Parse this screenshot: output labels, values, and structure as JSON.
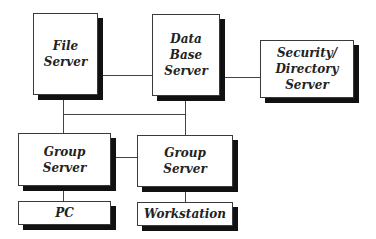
{
  "diagram": {
    "type": "network-topology",
    "nodes": [
      {
        "id": "file-server",
        "label": "File\nServer"
      },
      {
        "id": "database-server",
        "label": "Data\nBase\nServer"
      },
      {
        "id": "security-directory-server",
        "label": "Security/\nDirectory\nServer"
      },
      {
        "id": "group-server-1",
        "label": "Group\nServer"
      },
      {
        "id": "group-server-2",
        "label": "Group\nServer"
      },
      {
        "id": "pc",
        "label": "PC"
      },
      {
        "id": "workstation",
        "label": "Workstation"
      }
    ],
    "edges": [
      {
        "from": "file-server",
        "to": "database-server"
      },
      {
        "from": "database-server",
        "to": "security-directory-server"
      },
      {
        "from": "file-server",
        "to": "group-server-1"
      },
      {
        "from": "database-server",
        "to": "group-server-2"
      },
      {
        "from": "file-server",
        "to": "database-server",
        "via": "bus"
      },
      {
        "from": "group-server-1",
        "to": "group-server-2"
      },
      {
        "from": "group-server-1",
        "to": "pc"
      },
      {
        "from": "group-server-2",
        "to": "workstation"
      }
    ],
    "colors": {
      "box_fill": "#ffffff",
      "box_border": "#3a3a3a",
      "shadow": "#111111",
      "line": "#444444",
      "text": "#222222"
    }
  }
}
